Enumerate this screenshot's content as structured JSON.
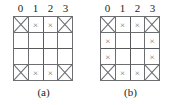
{
  "figure": {
    "background_color": "#ffffff",
    "line_color": "#6d6e71",
    "text_color": "#231f20",
    "panels": [
      {
        "id": "panel-a",
        "caption": "(a)",
        "column_headers": [
          "0",
          "1",
          "2",
          "3"
        ],
        "rows": [
          [
            "big",
            "small",
            "small",
            "big"
          ],
          [
            "empty",
            "empty",
            "empty",
            "empty"
          ],
          [
            "empty",
            "empty",
            "empty",
            "empty"
          ],
          [
            "big",
            "small",
            "small",
            "big"
          ]
        ]
      },
      {
        "id": "panel-b",
        "caption": "(b)",
        "column_headers": [
          "0",
          "1",
          "2",
          "3"
        ],
        "rows": [
          [
            "big",
            "small",
            "small",
            "big"
          ],
          [
            "small",
            "empty",
            "empty",
            "small"
          ],
          [
            "small",
            "empty",
            "empty",
            "small"
          ],
          [
            "big",
            "small",
            "small",
            "big"
          ]
        ]
      }
    ],
    "marks": {
      "small_glyph": "×",
      "big_glyph": "X"
    }
  }
}
